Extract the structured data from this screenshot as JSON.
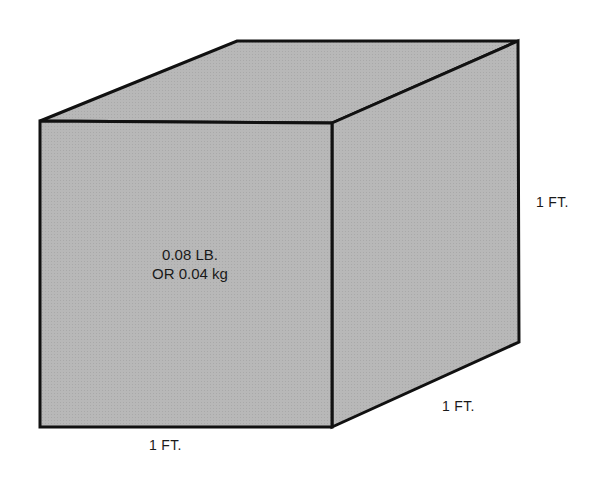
{
  "diagram": {
    "shape": "cube",
    "fill_color": "#b6b6b6",
    "edge_color": "#111111",
    "mass_label": {
      "line1": "0.08 LB.",
      "line2": "OR 0.04 kg"
    },
    "dimensions": {
      "width": "1 FT.",
      "depth": "1 FT.",
      "height": "1 FT."
    }
  }
}
